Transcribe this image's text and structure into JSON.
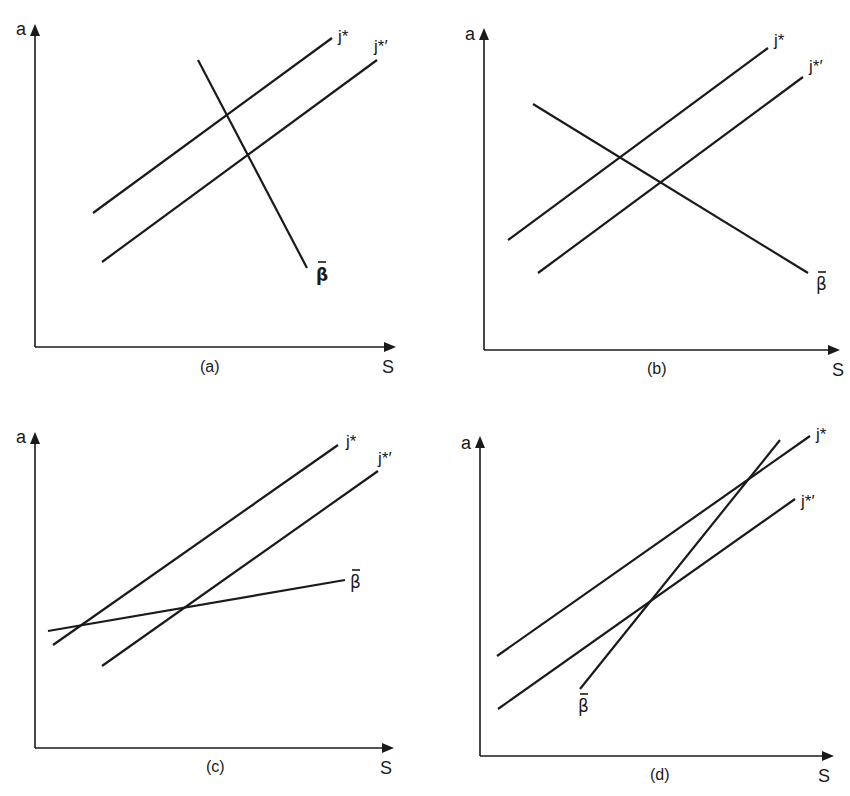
{
  "figure": {
    "panels": [
      {
        "id": "a",
        "caption": "(a)",
        "y_axis_label": "a",
        "x_axis_label": "S",
        "lines": [
          {
            "name": "j*",
            "label": "j*",
            "x1": 93,
            "y1": 213,
            "x2": 332,
            "y2": 38
          },
          {
            "name": "j*'",
            "label": "j*′",
            "x1": 102,
            "y1": 262,
            "x2": 377,
            "y2": 60
          },
          {
            "name": "beta-bar",
            "label": "β",
            "x1": 198,
            "y1": 60,
            "x2": 307,
            "y2": 268
          }
        ]
      },
      {
        "id": "b",
        "caption": "(b)",
        "y_axis_label": "a",
        "x_axis_label": "S",
        "lines": [
          {
            "name": "j*",
            "label": "j*",
            "x1": 508,
            "y1": 240,
            "x2": 768,
            "y2": 48
          },
          {
            "name": "j*'",
            "label": "j*′",
            "x1": 538,
            "y1": 273,
            "x2": 803,
            "y2": 77
          },
          {
            "name": "beta-bar",
            "label": "β",
            "x1": 533,
            "y1": 104,
            "x2": 808,
            "y2": 273
          }
        ]
      },
      {
        "id": "c",
        "caption": "(c)",
        "y_axis_label": "a",
        "x_axis_label": "S",
        "lines": [
          {
            "name": "j*",
            "label": "j*",
            "x1": 53,
            "y1": 645,
            "x2": 338,
            "y2": 445
          },
          {
            "name": "j*'",
            "label": "j*′",
            "x1": 102,
            "y1": 666,
            "x2": 378,
            "y2": 471
          },
          {
            "name": "beta-bar",
            "label": "β",
            "x1": 48,
            "y1": 631,
            "x2": 345,
            "y2": 580
          }
        ]
      },
      {
        "id": "d",
        "caption": "(d)",
        "y_axis_label": "a",
        "x_axis_label": "S",
        "lines": [
          {
            "name": "j*",
            "label": "j*",
            "x1": 497,
            "y1": 656,
            "x2": 810,
            "y2": 436
          },
          {
            "name": "j*'",
            "label": "j*′",
            "x1": 498,
            "y1": 709,
            "x2": 795,
            "y2": 499
          },
          {
            "name": "beta-bar",
            "label": "β",
            "x1": 580,
            "y1": 689,
            "x2": 780,
            "y2": 440
          }
        ]
      }
    ]
  },
  "chart_data": [
    {
      "type": "line",
      "title": "(a)",
      "xlabel": "S",
      "ylabel": "a",
      "grid": false,
      "series": [
        {
          "name": "j*",
          "points": [
            [
              0.16,
              0.42
            ],
            [
              0.83,
              0.96
            ]
          ]
        },
        {
          "name": "j*'",
          "points": [
            [
              0.19,
              0.27
            ],
            [
              0.96,
              0.89
            ]
          ]
        },
        {
          "name": "β̄",
          "points": [
            [
              0.46,
              0.89
            ],
            [
              0.75,
              0.25
            ]
          ]
        }
      ],
      "annotations": [
        "j* and j*' parallel upward-sloping; β̄ downward-sloping steeply"
      ]
    },
    {
      "type": "line",
      "title": "(b)",
      "xlabel": "S",
      "ylabel": "a",
      "grid": false,
      "series": [
        {
          "name": "j*",
          "points": [
            [
              0.07,
              0.34
            ],
            [
              0.81,
              0.94
            ]
          ]
        },
        {
          "name": "j*'",
          "points": [
            [
              0.15,
              0.24
            ],
            [
              0.91,
              0.85
            ]
          ]
        },
        {
          "name": "β̄",
          "points": [
            [
              0.14,
              0.77
            ],
            [
              0.92,
              0.24
            ]
          ]
        }
      ],
      "annotations": [
        "β̄ downward-sloping, shallower"
      ]
    },
    {
      "type": "line",
      "title": "(c)",
      "xlabel": "S",
      "ylabel": "a",
      "grid": false,
      "series": [
        {
          "name": "j*",
          "points": [
            [
              0.05,
              0.32
            ],
            [
              0.85,
              0.95
            ]
          ]
        },
        {
          "name": "j*'",
          "points": [
            [
              0.19,
              0.26
            ],
            [
              0.96,
              0.87
            ]
          ]
        },
        {
          "name": "β̄",
          "points": [
            [
              0.04,
              0.37
            ],
            [
              0.86,
              0.53
            ]
          ]
        }
      ],
      "annotations": [
        "β̄ upward-sloping, flatter than j*"
      ]
    },
    {
      "type": "line",
      "title": "(d)",
      "xlabel": "S",
      "ylabel": "a",
      "grid": false,
      "series": [
        {
          "name": "j*",
          "points": [
            [
              0.05,
              0.31
            ],
            [
              0.94,
              1.0
            ]
          ]
        },
        {
          "name": "j*'",
          "points": [
            [
              0.05,
              0.15
            ],
            [
              0.9,
              0.8
            ]
          ]
        },
        {
          "name": "β̄",
          "points": [
            [
              0.29,
              0.21
            ],
            [
              0.86,
              0.98
            ]
          ]
        }
      ],
      "annotations": [
        "β̄ upward-sloping, steeper than j*"
      ]
    }
  ]
}
